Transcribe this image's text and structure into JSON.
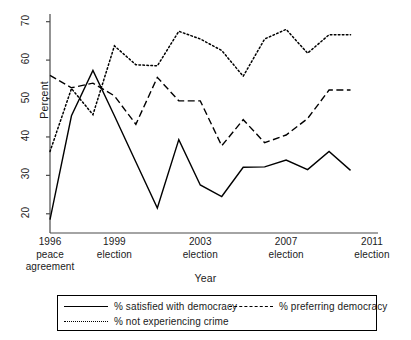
{
  "chart_data": {
    "type": "line",
    "title": "",
    "xlabel": "Year",
    "ylabel": "Percent",
    "xlim": [
      1996,
      2011
    ],
    "ylim": [
      15,
      72
    ],
    "yticks": [
      20,
      30,
      40,
      50,
      60,
      70
    ],
    "ytick_labels": [
      "20",
      "30",
      "40",
      "50",
      "60",
      "70"
    ],
    "xticks": [
      1996,
      1999,
      2003,
      2007,
      2011
    ],
    "xtick_labels": [
      {
        "year": "1996",
        "event": "peace",
        "event2": "agreement"
      },
      {
        "year": "1999",
        "event": "election",
        "event2": ""
      },
      {
        "year": "2003",
        "event": "election",
        "event2": ""
      },
      {
        "year": "2007",
        "event": "election",
        "event2": ""
      },
      {
        "year": "2011",
        "event": "election",
        "event2": ""
      }
    ],
    "grid": false,
    "legend_position": "below",
    "x": [
      1996,
      1997,
      1998,
      1999,
      2000,
      2001,
      2002,
      2003,
      2004,
      2005,
      2006,
      2007,
      2008,
      2009,
      2010
    ],
    "series": [
      {
        "name": "% satisfied with democracy",
        "style": "solid",
        "color": "#000000",
        "values": [
          18.5,
          45.5,
          57.3,
          45.5,
          33.5,
          21.5,
          39.3,
          27.5,
          24.5,
          32.1,
          32.2,
          34.0,
          31.5,
          36.2,
          31.3
        ]
      },
      {
        "name": "% preferring democracy",
        "style": "dashed",
        "color": "#000000",
        "values": [
          56.0,
          52.8,
          54.0,
          50.7,
          43.3,
          55.5,
          49.4,
          49.4,
          37.7,
          44.5,
          38.5,
          40.5,
          44.8,
          52.2,
          52.2
        ]
      },
      {
        "name": "% not experiencing crime",
        "style": "dotted",
        "color": "#000000",
        "values": [
          36.2,
          52.6,
          45.8,
          63.7,
          58.8,
          58.5,
          67.5,
          65.5,
          62.5,
          55.8,
          65.5,
          68.0,
          61.8,
          66.6,
          66.6
        ]
      }
    ]
  },
  "axis": {
    "ylabel": "Percent",
    "xlabel": "Year"
  },
  "legend": {
    "items": [
      {
        "label": "% satisfied with democracy",
        "style": "solid"
      },
      {
        "label": "% preferring democracy",
        "style": "dashed"
      },
      {
        "label": "% not experiencing crime",
        "style": "dotted"
      }
    ]
  }
}
